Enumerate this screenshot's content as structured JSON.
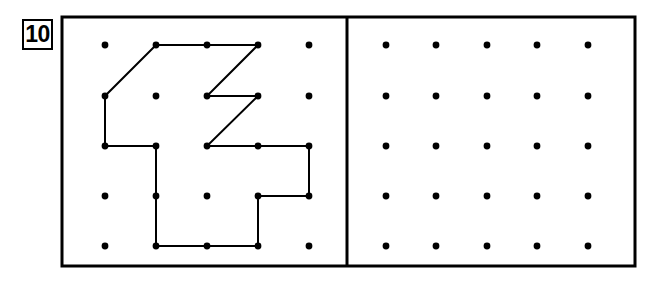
{
  "worksheet": {
    "problem_number": "10",
    "background_color": "#ffffff",
    "ink_color": "#000000",
    "width": 654,
    "height": 282
  },
  "frame": {
    "name": "outer-rectangle",
    "x": 62,
    "y": 17,
    "width": 573,
    "height": 249,
    "stroke_color": "#000000",
    "stroke_width": 3
  },
  "divider": {
    "name": "vertical-divider",
    "x": 347,
    "y1": 17,
    "y2": 266,
    "stroke_color": "#000000",
    "stroke_width": 3
  },
  "left_panel": {
    "name": "model-geoboard",
    "grid": {
      "rows": 5,
      "cols": 5,
      "dot_radius": 3.4,
      "dot_color": "#000000",
      "x_positions": [
        105,
        156,
        207,
        258,
        309
      ],
      "y_positions": [
        45,
        96,
        146,
        196,
        246
      ]
    },
    "figure": {
      "name": "rubber-band-shape",
      "closed": true,
      "stroke_color": "#000000",
      "stroke_width": 2,
      "vertices_grid": [
        [
          1,
          0
        ],
        [
          2,
          0
        ],
        [
          3,
          0
        ],
        [
          2,
          1
        ],
        [
          3,
          1
        ],
        [
          2,
          2
        ],
        [
          3,
          2
        ],
        [
          4,
          2
        ],
        [
          4,
          3
        ],
        [
          3,
          3
        ],
        [
          3,
          4
        ],
        [
          1,
          4
        ],
        [
          1,
          3
        ],
        [
          1,
          2
        ],
        [
          0,
          2
        ],
        [
          0,
          1
        ]
      ],
      "vertices_px": [
        [
          156,
          45
        ],
        [
          207,
          45
        ],
        [
          258,
          45
        ],
        [
          207,
          96
        ],
        [
          258,
          96
        ],
        [
          207,
          146
        ],
        [
          258,
          146
        ],
        [
          309,
          146
        ],
        [
          309,
          196
        ],
        [
          258,
          196
        ],
        [
          258,
          246
        ],
        [
          156,
          246
        ],
        [
          156,
          196
        ],
        [
          156,
          146
        ],
        [
          105,
          146
        ],
        [
          105,
          96
        ]
      ]
    }
  },
  "right_panel": {
    "name": "blank-geoboard",
    "grid": {
      "rows": 5,
      "cols": 5,
      "dot_radius": 3.4,
      "dot_color": "#000000",
      "x_positions": [
        386,
        436,
        487,
        537,
        588
      ],
      "y_positions": [
        45,
        96,
        146,
        196,
        246
      ]
    },
    "figure": null
  }
}
